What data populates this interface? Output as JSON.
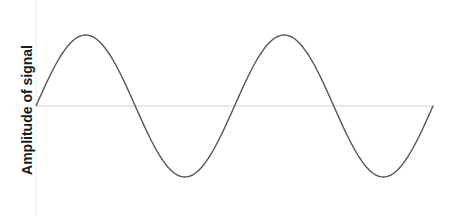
{
  "chart_data": {
    "type": "line",
    "title": "",
    "xlabel": "",
    "ylabel": "Amplitude of signal",
    "grid": false,
    "legend": null,
    "x_px_range": [
      36,
      433
    ],
    "baseline_y_px": 106,
    "amplitude_px": 71,
    "periods": 2,
    "series": [
      {
        "name": "signal",
        "x": [
          0,
          0.25,
          0.5,
          0.75,
          1.0,
          1.25,
          1.5,
          1.75,
          2.0
        ],
        "values": [
          0,
          1,
          0,
          -1,
          0,
          1,
          0,
          -1,
          0
        ]
      }
    ],
    "colors": {
      "line": "#555555",
      "axis": "#cccccc"
    }
  }
}
